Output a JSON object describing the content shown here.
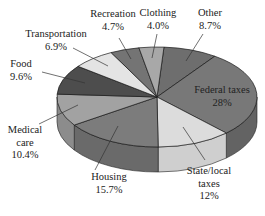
{
  "chart_data": {
    "type": "pie",
    "style": "3d-exploded-none",
    "title": "",
    "unit": "%",
    "slices": [
      {
        "label": "Other",
        "lines": [
          "Other",
          "8.7%"
        ],
        "value": 8.7,
        "color": "#6e6e6e",
        "side": "#5a5a5a",
        "label_pos": [
          210,
          16
        ],
        "leader": [
          [
            203,
            34
          ],
          [
            186,
            61
          ]
        ]
      },
      {
        "label": "Federal taxes",
        "lines": [
          "Federal taxes",
          "28%"
        ],
        "value": 28.0,
        "color": "#787878",
        "side": "#636363",
        "label_pos": [
          222,
          93
        ],
        "leader": null
      },
      {
        "label": "State/local taxes",
        "lines": [
          "State/local",
          "taxes",
          "12%"
        ],
        "value": 12.0,
        "color": "#dcdcdc",
        "side": "#cfcfcf",
        "label_pos": [
          209,
          174
        ],
        "leader": [
          [
            205,
            160
          ],
          [
            183,
            127
          ]
        ]
      },
      {
        "label": "Housing",
        "lines": [
          "Housing",
          "15.7%"
        ],
        "value": 15.7,
        "color": "#7c7c7c",
        "side": "#6a6a6a",
        "label_pos": [
          109,
          180
        ],
        "leader": [
          [
            95,
            170
          ],
          [
            118,
            126
          ]
        ]
      },
      {
        "label": "Medical care",
        "lines": [
          "Medical",
          "care",
          "10.4%"
        ],
        "value": 10.4,
        "color": "#a2a2a2",
        "side": "#8c8c8c",
        "label_pos": [
          25,
          133
        ],
        "leader": [
          [
            39,
            124
          ],
          [
            78,
            105
          ]
        ]
      },
      {
        "label": "Food",
        "lines": [
          "Food",
          "9.6%"
        ],
        "value": 9.6,
        "color": "#4d4d4d",
        "side": "#404040",
        "label_pos": [
          21,
          67
        ],
        "leader": [
          [
            42,
            72
          ],
          [
            85,
            83
          ]
        ]
      },
      {
        "label": "Transportation",
        "lines": [
          "Transportation",
          "6.9%"
        ],
        "value": 6.9,
        "color": "#e4e4e4",
        "side": "#d4d4d4",
        "label_pos": [
          56,
          37
        ],
        "leader": [
          [
            73,
            48
          ],
          [
            108,
            66
          ]
        ]
      },
      {
        "label": "Recreation",
        "lines": [
          "Recreation",
          "4.7%"
        ],
        "value": 4.7,
        "color": "#747474",
        "side": "#606060",
        "label_pos": [
          113,
          17
        ],
        "leader": [
          [
            119,
            38
          ],
          [
            131,
            59
          ]
        ]
      },
      {
        "label": "Clothing",
        "lines": [
          "Clothing",
          "4.0%"
        ],
        "value": 4.0,
        "color": "#a8a8a8",
        "side": "#959595",
        "label_pos": [
          158,
          16
        ],
        "leader": [
          [
            157,
            34
          ],
          [
            152,
            58
          ]
        ]
      }
    ],
    "layout": {
      "cx": 157,
      "cy": 97,
      "rx": 100,
      "ry": 50,
      "depth": 25,
      "start_deg": -86
    }
  }
}
